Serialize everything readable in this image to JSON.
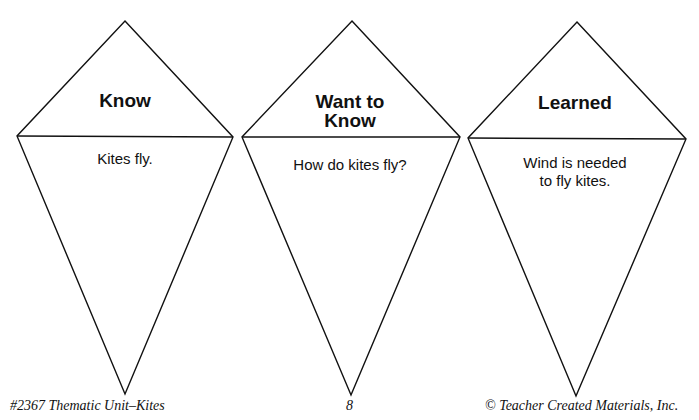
{
  "kites": [
    {
      "title": "Know",
      "body_line1": "Kites fly.",
      "body_line2": ""
    },
    {
      "title_line1": "Want to",
      "title_line2": "Know",
      "body_line1": "How do kites fly?",
      "body_line2": ""
    },
    {
      "title": "Learned",
      "body_line1": "Wind is needed",
      "body_line2": "to fly kites."
    }
  ],
  "footer": {
    "left": "#2367 Thematic Unit–Kites",
    "center": "8",
    "right": "© Teacher Created Materials, Inc."
  }
}
